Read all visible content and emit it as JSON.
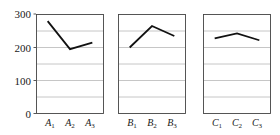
{
  "chart_data": {
    "type": "line",
    "title": "",
    "subtitle": "",
    "xlabel": "",
    "ylabel": "",
    "ylim": [
      0,
      300
    ],
    "yticks": [
      0,
      100,
      200,
      300
    ],
    "ytick_labels": [
      "0",
      "100",
      "200",
      "300"
    ],
    "gridlines": [
      0,
      50,
      100,
      150,
      200,
      250,
      300
    ],
    "grid": true,
    "legend": "none",
    "panel_layout": "1x3 small multiples, shared y-axis",
    "panels": [
      {
        "name": "A",
        "categories": [
          "A1",
          "A2",
          "A3"
        ],
        "category_labels": [
          "A",
          "A",
          "A"
        ],
        "category_subscripts": [
          "1",
          "2",
          "3"
        ],
        "values": [
          280,
          195,
          215
        ]
      },
      {
        "name": "B",
        "categories": [
          "B1",
          "B2",
          "B3"
        ],
        "category_labels": [
          "B",
          "B",
          "B"
        ],
        "category_subscripts": [
          "1",
          "2",
          "3"
        ],
        "values": [
          200,
          265,
          235
        ]
      },
      {
        "name": "C",
        "categories": [
          "C1",
          "C2",
          "C3"
        ],
        "category_labels": [
          "C",
          "C",
          "C"
        ],
        "category_subscripts": [
          "1",
          "2",
          "3"
        ],
        "values": [
          228,
          243,
          222
        ]
      }
    ],
    "colors": {
      "line": "#111111",
      "gridline": "#b8b8b8",
      "frame": "#444444",
      "background": "#ffffff",
      "text": "#1a1a1a"
    }
  }
}
